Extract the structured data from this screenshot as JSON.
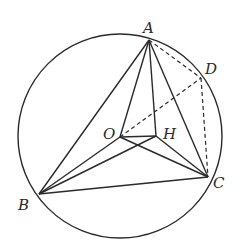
{
  "diagram": {
    "type": "geometry",
    "circle": {
      "center": "O",
      "cx": 120,
      "cy": 136,
      "r": 102
    },
    "points": {
      "A": {
        "label": "A",
        "x": 149,
        "y": 40,
        "lx": 143,
        "ly": 33
      },
      "D": {
        "label": "D",
        "x": 201,
        "y": 78,
        "lx": 205,
        "ly": 74
      },
      "C": {
        "label": "C",
        "x": 208,
        "y": 177,
        "lx": 213,
        "ly": 188
      },
      "B": {
        "label": "B",
        "x": 39,
        "y": 194,
        "lx": 18,
        "ly": 210
      },
      "O": {
        "label": "O",
        "x": 120,
        "y": 137,
        "lx": 103,
        "ly": 139
      },
      "H": {
        "label": "H",
        "x": 156,
        "y": 136,
        "lx": 163,
        "ly": 139
      }
    },
    "solid_segments": [
      [
        "A",
        "B"
      ],
      [
        "A",
        "O"
      ],
      [
        "A",
        "H"
      ],
      [
        "A",
        "C"
      ],
      [
        "B",
        "C"
      ],
      [
        "B",
        "O"
      ],
      [
        "B",
        "H"
      ],
      [
        "O",
        "H"
      ],
      [
        "O",
        "C"
      ],
      [
        "H",
        "C"
      ]
    ],
    "dashed_segments": [
      [
        "A",
        "D"
      ],
      [
        "D",
        "C"
      ],
      [
        "O",
        "D"
      ]
    ]
  }
}
